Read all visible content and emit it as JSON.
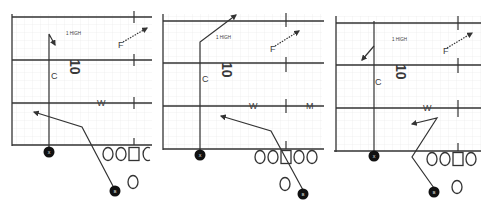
{
  "colors": {
    "line": "#333333",
    "grid": "#e3e3e3",
    "player_fill": "#111111",
    "player_text": "#ffffff",
    "label": "#3a3a3a",
    "background": "#ffffff"
  },
  "panels": [
    {
      "id": "panel-1",
      "coverage_label": "1 HIGH",
      "defense_number": "10",
      "defenders": {
        "corner": "C",
        "free_safety": "F",
        "will": "W"
      },
      "receiver_x": "X",
      "receiver_b": "B",
      "offensive_line": [
        "O",
        "O",
        "□",
        "C"
      ],
      "quarterback": "O"
    },
    {
      "id": "panel-2",
      "coverage_label": "1 HIGH",
      "defense_number": "10",
      "defenders": {
        "corner": "C",
        "free_safety": "F",
        "will": "W",
        "mike": "M"
      },
      "receiver_x": "X",
      "receiver_b": "B",
      "offensive_line": [
        "O",
        "O",
        "□",
        "O",
        "O"
      ],
      "quarterback": "O"
    },
    {
      "id": "panel-3",
      "coverage_label": "1 HIGH",
      "defense_number": "10",
      "defenders": {
        "corner": "C",
        "free_safety": "F",
        "will": "W"
      },
      "receiver_x": "X",
      "receiver_b": "B",
      "offensive_line": [
        "O",
        "O",
        "□",
        "O"
      ],
      "quarterback": "O"
    }
  ]
}
